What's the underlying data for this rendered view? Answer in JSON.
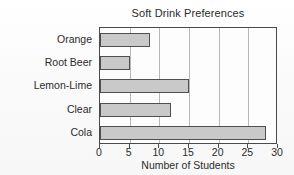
{
  "chart_data": {
    "type": "bar",
    "orientation": "horizontal",
    "title": "Soft Drink Preferences",
    "xlabel": "Number of Students",
    "ylabel": "Drink Type",
    "categories": [
      "Cola",
      "Clear",
      "Lemon-Lime",
      "Root Beer",
      "Orange"
    ],
    "values": [
      28,
      12,
      15,
      5,
      8.5
    ],
    "xlim": [
      0,
      30
    ],
    "xticks": [
      0,
      5,
      10,
      15,
      20,
      25,
      30
    ],
    "xtick_labels": [
      "0",
      "5",
      "10",
      "15",
      "20",
      "25",
      "30"
    ],
    "grid": true,
    "grid_axis": "x",
    "legend": false,
    "bar_fill_color": "#c9c9c9",
    "bar_edge_color": "#4f4f4f",
    "axis_color": "#4a4a4a",
    "grid_color": "#b8b8b8",
    "text_color": "#2b2b2b",
    "background_color": "#fbfbfb",
    "plot_background_color": "#fdfdfd"
  }
}
